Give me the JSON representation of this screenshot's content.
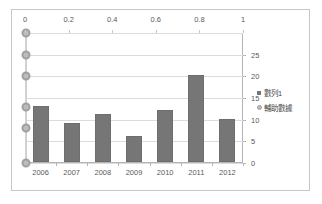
{
  "chart_data": {
    "type": "bar",
    "title": "",
    "xlabel": "",
    "ylabel": "",
    "categories": [
      "2006",
      "2007",
      "2008",
      "2009",
      "2010",
      "2011",
      "2012"
    ],
    "series": [
      {
        "name": "數列1",
        "marker": "square",
        "color": "#767676",
        "axis": "right",
        "values": [
          13,
          9,
          11,
          6,
          12,
          20,
          10
        ]
      },
      {
        "name": "輔助數據",
        "marker": "circle",
        "color": "#bcbcbc",
        "axis": "right",
        "x": [
          0,
          0,
          0,
          0,
          0,
          0
        ],
        "values": [
          30,
          25,
          20,
          13,
          8,
          0
        ]
      }
    ],
    "primary_y_axis": {
      "position": "right",
      "ticks": [
        "0",
        "5",
        "10",
        "15",
        "20",
        "25"
      ],
      "values": [
        0,
        5,
        10,
        15,
        20,
        25
      ],
      "ylim": [
        0,
        30
      ]
    },
    "secondary_x_axis": {
      "position": "top",
      "ticks": [
        "0",
        "0.2",
        "0.4",
        "0.6",
        "0.8",
        "1"
      ],
      "values": [
        0,
        0.2,
        0.4,
        0.6,
        0.8,
        1
      ],
      "xlim": [
        0,
        1
      ]
    },
    "grid": true,
    "legend_position": "right",
    "legend": [
      "數列1",
      "輔助數據"
    ]
  }
}
